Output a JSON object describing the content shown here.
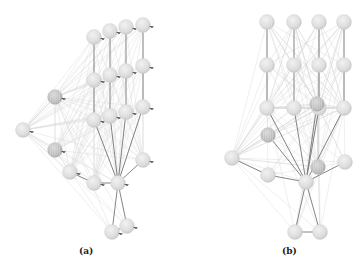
{
  "figure": {
    "panels": [
      {
        "id": "a",
        "label": "(a)",
        "label_pos": [
          85,
          252
        ],
        "nodes": [
          {
            "x": 94,
            "y": 37
          },
          {
            "x": 110,
            "y": 31
          },
          {
            "x": 126,
            "y": 27
          },
          {
            "x": 143,
            "y": 25
          },
          {
            "x": 94,
            "y": 80
          },
          {
            "x": 110,
            "y": 75
          },
          {
            "x": 126,
            "y": 71
          },
          {
            "x": 143,
            "y": 66
          },
          {
            "x": 94,
            "y": 120
          },
          {
            "x": 110,
            "y": 116
          },
          {
            "x": 126,
            "y": 112
          },
          {
            "x": 143,
            "y": 107
          },
          {
            "x": 55,
            "y": 97,
            "dark": true
          },
          {
            "x": 23,
            "y": 130
          },
          {
            "x": 55,
            "y": 150,
            "dark": true
          },
          {
            "x": 70,
            "y": 172
          },
          {
            "x": 94,
            "y": 183
          },
          {
            "x": 118,
            "y": 183
          },
          {
            "x": 143,
            "y": 160
          },
          {
            "x": 112,
            "y": 232
          },
          {
            "x": 127,
            "y": 226
          }
        ],
        "strong_edges": [
          [
            0,
            4
          ],
          [
            4,
            8
          ],
          [
            1,
            5
          ],
          [
            5,
            9
          ],
          [
            2,
            6
          ],
          [
            6,
            10
          ],
          [
            3,
            7
          ],
          [
            7,
            11
          ],
          [
            8,
            17
          ],
          [
            9,
            17
          ],
          [
            10,
            17
          ],
          [
            11,
            17
          ],
          [
            17,
            19
          ],
          [
            17,
            20
          ],
          [
            16,
            17
          ],
          [
            17,
            18
          ],
          [
            15,
            16
          ],
          [
            19,
            20
          ]
        ],
        "faint_hubs": [
          12,
          13,
          14
        ],
        "arrows": true
      },
      {
        "id": "b",
        "label": "(b)",
        "label_pos": [
          288,
          252
        ],
        "nodes": [
          {
            "x": 267,
            "y": 22
          },
          {
            "x": 294,
            "y": 22
          },
          {
            "x": 319,
            "y": 22
          },
          {
            "x": 344,
            "y": 22
          },
          {
            "x": 267,
            "y": 65
          },
          {
            "x": 294,
            "y": 65
          },
          {
            "x": 319,
            "y": 65
          },
          {
            "x": 344,
            "y": 65
          },
          {
            "x": 267,
            "y": 108
          },
          {
            "x": 294,
            "y": 108
          },
          {
            "x": 319,
            "y": 108
          },
          {
            "x": 344,
            "y": 108
          },
          {
            "x": 268,
            "y": 135,
            "dark": true
          },
          {
            "x": 232,
            "y": 158
          },
          {
            "x": 268,
            "y": 175
          },
          {
            "x": 306,
            "y": 182
          },
          {
            "x": 345,
            "y": 162
          },
          {
            "x": 318,
            "y": 167,
            "dark": true
          },
          {
            "x": 295,
            "y": 232
          },
          {
            "x": 320,
            "y": 232
          },
          {
            "x": 317,
            "y": 104,
            "dark": true
          }
        ],
        "strong_edges": [
          [
            0,
            4
          ],
          [
            4,
            8
          ],
          [
            1,
            5
          ],
          [
            5,
            9
          ],
          [
            2,
            6
          ],
          [
            6,
            10
          ],
          [
            3,
            7
          ],
          [
            7,
            11
          ],
          [
            8,
            15
          ],
          [
            9,
            15
          ],
          [
            10,
            15
          ],
          [
            11,
            15
          ],
          [
            12,
            15
          ],
          [
            13,
            14
          ],
          [
            14,
            15
          ],
          [
            15,
            16
          ],
          [
            15,
            18
          ],
          [
            15,
            19
          ],
          [
            18,
            19
          ],
          [
            20,
            15
          ]
        ],
        "faint_hubs": [
          8,
          9,
          10,
          11,
          12,
          13,
          17,
          20
        ],
        "arrows": false
      }
    ]
  }
}
